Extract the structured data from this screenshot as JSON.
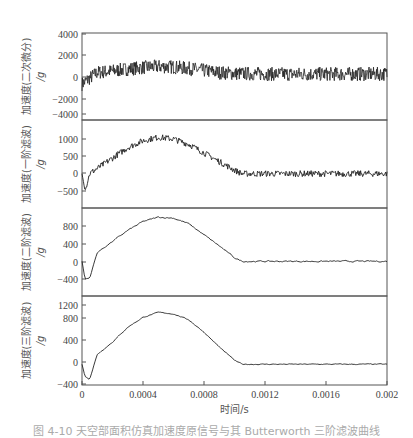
{
  "chart_data": [
    {
      "type": "line",
      "panel": 1,
      "ylabel": "加速度(二次微分) /g",
      "yticks": [
        4000,
        2000,
        0,
        -2000,
        -4000
      ],
      "ylim": [
        -4500,
        4000
      ],
      "noise": "high",
      "description": "Very noisy signal rising to ~+700 mean near t=0.0005, then settling to ~0 mean with ±600 noise",
      "x": [
        0,
        0.0001,
        0.0002,
        0.0003,
        0.0004,
        0.0005,
        0.0006,
        0.0007,
        0.0008,
        0.0009,
        0.001,
        0.0012,
        0.0014,
        0.0016,
        0.0018,
        0.002
      ],
      "mean": [
        -1000,
        150,
        300,
        500,
        650,
        750,
        700,
        550,
        350,
        150,
        50,
        0,
        0,
        0,
        0,
        0
      ],
      "noise_amp": 700
    },
    {
      "type": "line",
      "panel": 2,
      "ylabel": "加速度(一阶滤波) /g",
      "yticks": [
        1000,
        500,
        0,
        -500
      ],
      "ylim": [
        -750,
        1350
      ],
      "description": "Noisy half-sine pulse peaking ~1050 at t≈0.00055 s, returns to 0 by ~0.00105 s",
      "x": [
        0,
        2e-05,
        5e-05,
        0.0001,
        0.0002,
        0.0003,
        0.0004,
        0.0005,
        0.0006,
        0.0007,
        0.0008,
        0.0009,
        0.001,
        0.00105,
        0.0012,
        0.0014,
        0.0016,
        0.0018,
        0.002
      ],
      "mean": [
        0,
        -500,
        0,
        150,
        450,
        750,
        950,
        1050,
        1000,
        850,
        600,
        350,
        100,
        0,
        0,
        0,
        0,
        0,
        0
      ],
      "noise_amp": 90
    },
    {
      "type": "line",
      "panel": 3,
      "ylabel": "加速度(二阶滤波) /g",
      "yticks": [
        800,
        400,
        0,
        -400
      ],
      "ylim": [
        -650,
        1250
      ],
      "description": "Smoother half-sine peaking ~1000 at t≈0.00055 s, initial dip to ~-400",
      "x": [
        0,
        2e-05,
        5e-05,
        0.0001,
        0.0002,
        0.0003,
        0.0004,
        0.0005,
        0.0006,
        0.0007,
        0.0008,
        0.0009,
        0.001,
        0.00105,
        0.0012,
        0.0014,
        0.0016,
        0.0018,
        0.002
      ],
      "mean": [
        0,
        -400,
        -380,
        200,
        450,
        700,
        900,
        1000,
        980,
        850,
        600,
        350,
        80,
        0,
        0,
        0,
        0,
        0,
        0
      ],
      "noise_amp": 30
    },
    {
      "type": "line",
      "panel": 4,
      "ylabel": "加速度(三阶滤波) /g",
      "yticks": [
        1200,
        800,
        400,
        0,
        -400
      ],
      "ylim": [
        -400,
        1300
      ],
      "description": "Smoothest half-sine peaking ~1050 at t≈0.00055 s, initial dip to ~-300",
      "x": [
        0,
        2e-05,
        5e-05,
        0.0001,
        0.0002,
        0.0003,
        0.0004,
        0.0005,
        0.0006,
        0.0007,
        0.0008,
        0.0009,
        0.001,
        0.00105,
        0.0012,
        0.0014,
        0.0016,
        0.0018,
        0.002
      ],
      "mean": [
        0,
        -250,
        -300,
        200,
        450,
        750,
        950,
        1050,
        1020,
        900,
        650,
        350,
        80,
        0,
        0,
        0,
        0,
        0,
        0
      ],
      "noise_amp": 18
    }
  ],
  "xaxis": {
    "label": "时间/s",
    "xlim": [
      0,
      0.002
    ],
    "ticks": [
      "0",
      "0.0004",
      "0.0008",
      "0.0012",
      "0.0016",
      "0.002"
    ]
  },
  "panels": [
    {
      "ylabel": "加速度(二次微分)",
      "yunit": "/g",
      "ticks": [
        {
          "v": "4000",
          "y": 34
        },
        {
          "v": "2000",
          "y": 55
        },
        {
          "v": "0",
          "y": 77
        },
        {
          "v": "−2000",
          "y": 99
        },
        {
          "v": "−4000",
          "y": 114
        }
      ]
    },
    {
      "ylabel": "加速度(一阶滤波)",
      "yunit": "/g",
      "ticks": [
        {
          "v": "1000",
          "y": 139
        },
        {
          "v": "500",
          "y": 156
        },
        {
          "v": "0",
          "y": 173
        },
        {
          "v": "−500",
          "y": 191
        }
      ]
    },
    {
      "ylabel": "加速度(二阶滤波)",
      "yunit": "/g",
      "ticks": [
        {
          "v": "800",
          "y": 226
        },
        {
          "v": "400",
          "y": 244
        },
        {
          "v": "0",
          "y": 262
        },
        {
          "v": "−400",
          "y": 279
        }
      ]
    },
    {
      "ylabel": "加速度(三阶滤波)",
      "yunit": "/g",
      "ticks": [
        {
          "v": "1200",
          "y": 305
        },
        {
          "v": "800",
          "y": 318
        },
        {
          "v": "400",
          "y": 340
        },
        {
          "v": "0",
          "y": 362
        },
        {
          "v": "−400",
          "y": 384
        }
      ]
    }
  ],
  "caption": "图 4-10 天空部面积仿真加速度原信号与其 Butterworth 三阶滤波曲线",
  "colors": {
    "line": "#222222",
    "axis": "#555555",
    "tick_text": "#444444"
  }
}
